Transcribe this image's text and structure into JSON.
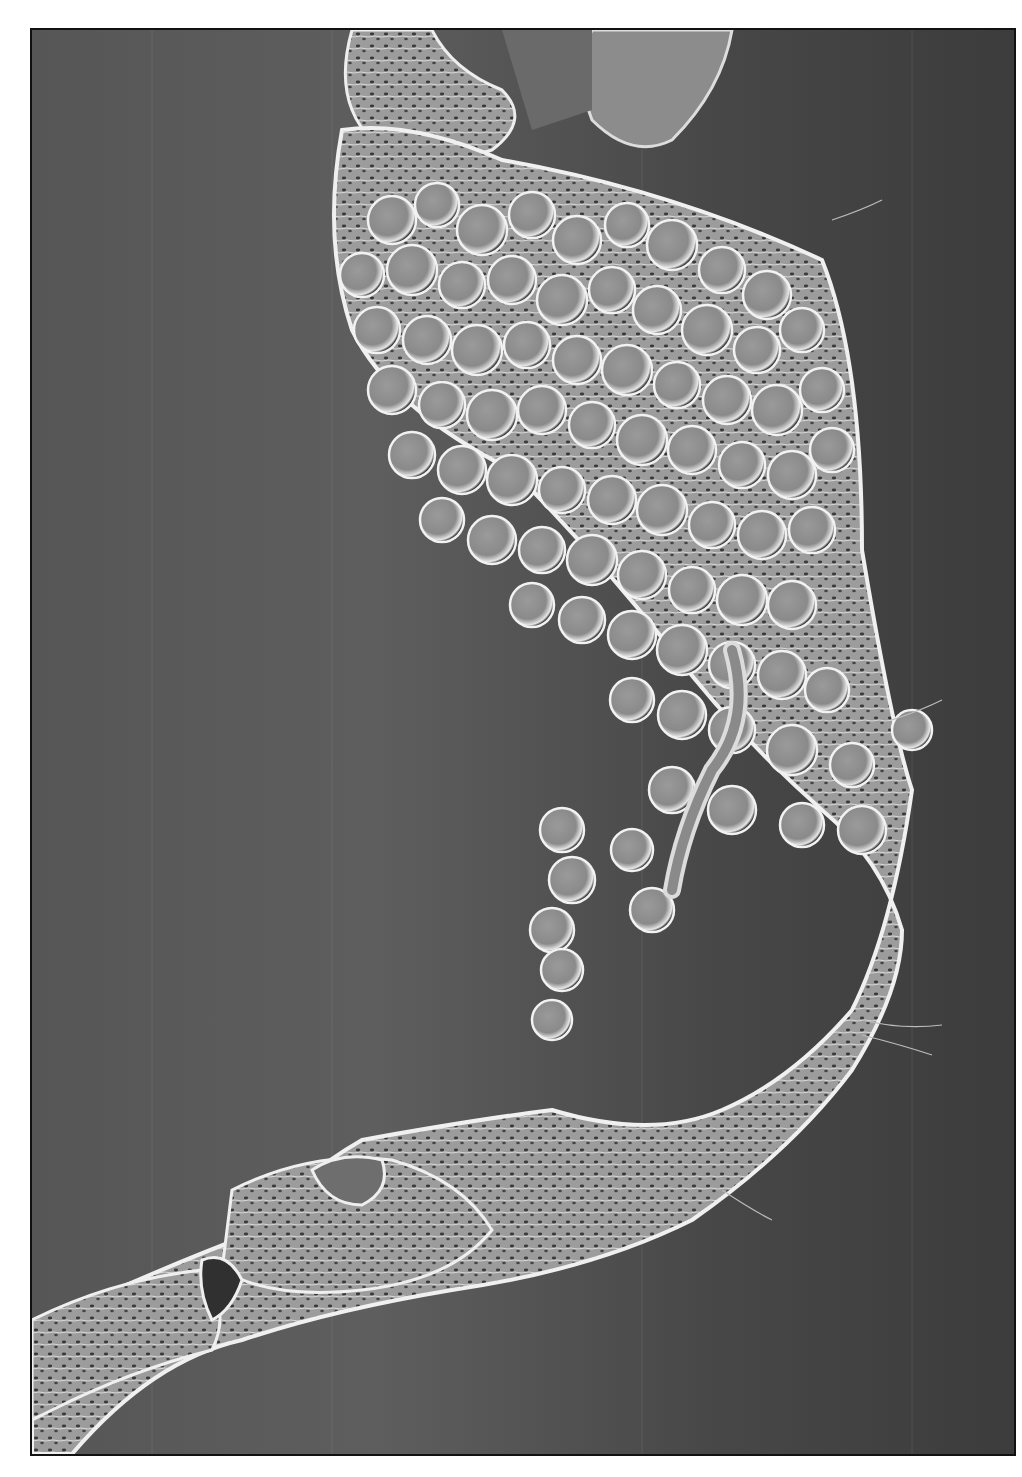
{
  "image": {
    "kind": "scanning electron micrograph",
    "description": "Grayscale SEM image of a curved biological specimen with a dense cluster of spherical bodies on its upper portion and a segmented, textured stalk extending to the lower-left corner",
    "palette": {
      "background": "#4a4a4a",
      "frame_border": "#111111",
      "page": "#ffffff",
      "specimen_mid": "#8a8a8a",
      "specimen_highlight": "#e8e8e8",
      "specimen_shadow": "#2e2e2e"
    }
  }
}
